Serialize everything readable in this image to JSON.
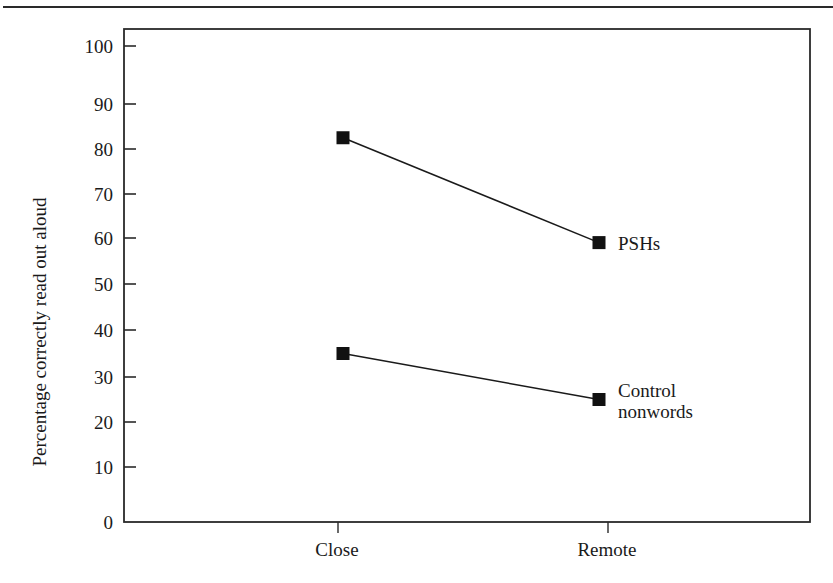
{
  "chart_data": {
    "type": "line",
    "title": "",
    "xlabel": "",
    "ylabel": "Percentage correctly read out aloud",
    "categories": [
      "Close",
      "Remote"
    ],
    "series": [
      {
        "name": "PSHs",
        "values": [
          82.5,
          59
        ],
        "label_lines": [
          "PSHs"
        ]
      },
      {
        "name": "Control nonwords",
        "values": [
          35,
          25
        ],
        "label_lines": [
          "Control",
          "nonwords"
        ]
      }
    ],
    "ylim": [
      0,
      100
    ],
    "yticks": [
      0,
      10,
      20,
      30,
      40,
      50,
      60,
      70,
      80,
      90,
      100
    ],
    "grid": false,
    "legend": "inline labels at right end of each line",
    "marker": "filled-square",
    "colors": {
      "line": "#1a1a1a",
      "marker": "#111111",
      "axis": "#2a2a2a"
    }
  }
}
